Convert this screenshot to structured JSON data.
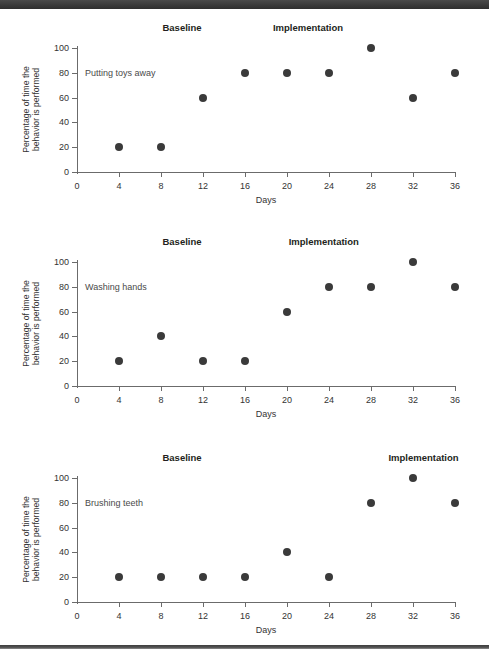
{
  "page": {
    "top_band_text": "",
    "background": "#ffffff",
    "dot_color": "#3a3a3a",
    "axis_color": "#6b6b6b"
  },
  "chart_data": [
    {
      "type": "scatter",
      "title": "Putting toys away",
      "series_label": "Putting toys away",
      "xlabel": "Days",
      "ylabel": "Percentage of time the behavior is performed",
      "ylabel_line1": "Percentage of time the",
      "ylabel_line2": "behavior is performed",
      "x": [
        4,
        8,
        12,
        16,
        20,
        24,
        28,
        32,
        36
      ],
      "values": [
        20,
        20,
        60,
        80,
        80,
        80,
        100,
        60,
        80
      ],
      "xticks": [
        0,
        4,
        8,
        12,
        16,
        20,
        24,
        28,
        32,
        36
      ],
      "yticks": [
        0,
        20,
        40,
        60,
        80,
        100
      ],
      "xlim": [
        0,
        36
      ],
      "ylim": [
        0,
        100
      ],
      "grid": false,
      "annotations": [
        {
          "text": "Baseline",
          "x": 10
        },
        {
          "text": "Implementation",
          "x": 22
        }
      ]
    },
    {
      "type": "scatter",
      "title": "Washing hands",
      "series_label": "Washing hands",
      "xlabel": "Days",
      "ylabel": "Percentage of time the behavior is performed",
      "ylabel_line1": "Percentage of time the",
      "ylabel_line2": "behavior is performed",
      "x": [
        4,
        8,
        12,
        16,
        20,
        24,
        28,
        32,
        36
      ],
      "values": [
        20,
        40,
        20,
        20,
        60,
        80,
        80,
        100,
        80
      ],
      "xticks": [
        0,
        4,
        8,
        12,
        16,
        20,
        24,
        28,
        32,
        36
      ],
      "yticks": [
        0,
        20,
        40,
        60,
        80,
        100
      ],
      "xlim": [
        0,
        36
      ],
      "ylim": [
        0,
        100
      ],
      "grid": false,
      "annotations": [
        {
          "text": "Baseline",
          "x": 10
        },
        {
          "text": "Implementation",
          "x": 23.5
        }
      ]
    },
    {
      "type": "scatter",
      "title": "Brushing teeth",
      "series_label": "Brushing teeth",
      "xlabel": "Days",
      "ylabel": "Percentage of time the behavior is performed",
      "ylabel_line1": "Percentage of time the",
      "ylabel_line2": "behavior is performed",
      "x": [
        4,
        8,
        12,
        16,
        20,
        24,
        28,
        32,
        36
      ],
      "values": [
        20,
        20,
        20,
        20,
        40,
        20,
        80,
        100,
        80
      ],
      "xticks": [
        0,
        4,
        8,
        12,
        16,
        20,
        24,
        28,
        32,
        36
      ],
      "yticks": [
        0,
        20,
        40,
        60,
        80,
        100
      ],
      "xlim": [
        0,
        36
      ],
      "ylim": [
        0,
        100
      ],
      "grid": false,
      "annotations": [
        {
          "text": "Baseline",
          "x": 10
        },
        {
          "text": "Implementation",
          "x": 33
        }
      ]
    }
  ]
}
